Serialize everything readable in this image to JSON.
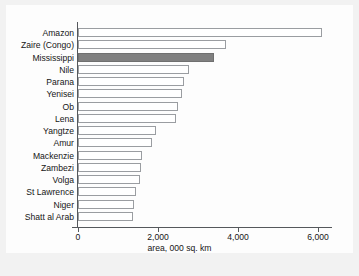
{
  "chart_data": {
    "type": "bar",
    "orientation": "horizontal",
    "title": "",
    "xlabel": "area, 000 sq. km",
    "ylabel": "",
    "xlim": [
      0,
      6500
    ],
    "xticks": [
      0,
      2000,
      4000,
      6000
    ],
    "xtick_labels": [
      "0",
      "2,000",
      "4,000",
      "6,000"
    ],
    "grid": false,
    "legend": "none",
    "highlight_category": "Mississippi",
    "colors": {
      "bar_fill": "#ffffff",
      "bar_edge": "#9a9da1",
      "highlight_fill": "#808080",
      "axis": "#55585c",
      "text": "#161616",
      "figure_background": "#f2f2f2",
      "axes_background": "#fdfdfd"
    },
    "categories": [
      "Amazon",
      "Zaire (Congo)",
      "Mississippi",
      "Nile",
      "Parana",
      "Yenisei",
      "Ob",
      "Lena",
      "Yangtze",
      "Amur",
      "Mackenzie",
      "Zambezi",
      "Volga",
      "St Lawrence",
      "Niger",
      "Shatt al Arab"
    ],
    "values": [
      6100,
      3700,
      3400,
      2770,
      2650,
      2600,
      2500,
      2450,
      1950,
      1840,
      1600,
      1570,
      1550,
      1450,
      1390,
      1370
    ]
  }
}
